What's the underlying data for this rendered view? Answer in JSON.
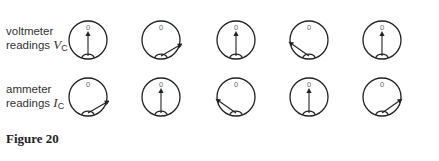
{
  "rows": [
    {
      "label_line1": "voltmeter",
      "label_line2": "readings",
      "symbol": "V",
      "subscript": "C",
      "dials": [
        {
          "zero_label": "0",
          "needle_angle_deg": 0
        },
        {
          "zero_label": "0",
          "needle_angle_deg": 60
        },
        {
          "zero_label": "0",
          "needle_angle_deg": 0
        },
        {
          "zero_label": "0",
          "needle_angle_deg": -55
        },
        {
          "zero_label": "0",
          "needle_angle_deg": 0
        }
      ]
    },
    {
      "label_line1": "ammeter",
      "label_line2": "readings",
      "symbol": "I",
      "subscript": "C",
      "dials": [
        {
          "zero_label": "0",
          "needle_angle_deg": 60
        },
        {
          "zero_label": "0",
          "needle_angle_deg": 0
        },
        {
          "zero_label": "0",
          "needle_angle_deg": -55
        },
        {
          "zero_label": "0",
          "needle_angle_deg": 0
        },
        {
          "zero_label": "0",
          "needle_angle_deg": 55
        }
      ]
    }
  ],
  "caption": "Figure 20",
  "colors": {
    "stroke": "#222222",
    "zero_label": "#666666"
  }
}
